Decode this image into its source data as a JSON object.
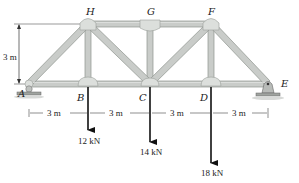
{
  "diagram": {
    "type": "truss",
    "joints": {
      "A": "A",
      "B": "B",
      "C": "C",
      "D": "D",
      "E": "E",
      "F": "F",
      "G": "G",
      "H": "H"
    },
    "height_dim": "3 m",
    "span_dims": [
      "3 m",
      "3 m",
      "3 m",
      "3 m"
    ],
    "loads": [
      {
        "joint": "B",
        "label": "12 kN"
      },
      {
        "joint": "C",
        "label": "14 kN"
      },
      {
        "joint": "D",
        "label": "18 kN"
      }
    ],
    "supports": {
      "A": "roller",
      "E": "pin"
    },
    "colors": {
      "member_fill": "#c9ccc9",
      "member_edge": "#8e938e",
      "gusset": "#d8dbd8",
      "ink": "#111111"
    }
  }
}
